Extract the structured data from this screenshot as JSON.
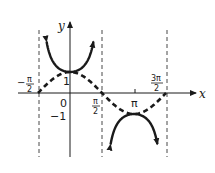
{
  "chart_data": {
    "type": "line",
    "title": "",
    "xlabel": "x",
    "ylabel": "y",
    "x_ticks": [
      {
        "value": -1.5708,
        "label_num": "π",
        "label_den": "2",
        "sign": "−"
      },
      {
        "value": 0,
        "label": "0"
      },
      {
        "value": 1.5708,
        "label_num": "π",
        "label_den": "2",
        "sign": ""
      },
      {
        "value": 3.1416,
        "label": "π"
      },
      {
        "value": 4.7124,
        "label_num": "3π",
        "label_den": "2",
        "sign": ""
      }
    ],
    "y_ticks": [
      {
        "value": 1,
        "label": "1"
      },
      {
        "value": -1,
        "label": "−1"
      }
    ],
    "xlim": [
      -2.0,
      5.6
    ],
    "ylim": [
      -2.9,
      3.0
    ],
    "asymptotes_x": [
      -1.5708,
      1.5708,
      4.7124
    ],
    "series": [
      {
        "name": "y = sec x",
        "style": "solid",
        "function": "sec",
        "domain_pieces": [
          [
            -1.15,
            1.15
          ],
          [
            1.99,
            4.29
          ]
        ]
      },
      {
        "name": "y = cos x",
        "style": "dashed",
        "function": "cos",
        "domain": [
          -1.5708,
          4.7124
        ]
      }
    ],
    "grid": false,
    "legend": null
  },
  "labels": {
    "x_axis": "x",
    "y_axis": "y",
    "zero": "0",
    "one": "1",
    "neg_one": "−1",
    "pi": "π",
    "neg_pi_half_sign": "−",
    "pi_num": "π",
    "three_pi_num": "3π",
    "den": "2"
  }
}
